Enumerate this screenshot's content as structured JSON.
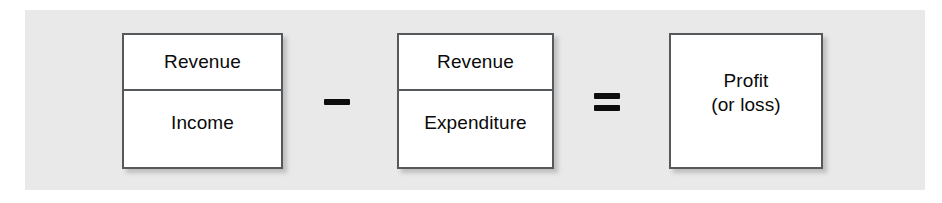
{
  "diagram": {
    "type": "equation-diagram",
    "background_color": "#ffffff",
    "panel_color": "#e9e9e9",
    "box_border_color": "#55595c",
    "box_fill_color": "#ffffff",
    "text_color": "#0a0a0a"
  },
  "boxes": [
    {
      "id": "income",
      "cells": [
        {
          "label": "Revenue"
        },
        {
          "label": "Income"
        }
      ]
    },
    {
      "id": "expenditure",
      "cells": [
        {
          "label": "Revenue"
        },
        {
          "label": "Expenditure"
        }
      ]
    },
    {
      "id": "profit",
      "cells": [
        {
          "label_line1": "Profit",
          "label_line2": "(or loss)"
        }
      ]
    }
  ],
  "operators": [
    {
      "id": "minus",
      "symbol": "−",
      "name": "minus-sign"
    },
    {
      "id": "equals",
      "symbol": "=",
      "name": "equals-sign"
    }
  ]
}
